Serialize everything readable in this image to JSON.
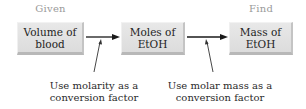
{
  "headers": {
    "given": "Given",
    "find": "Find"
  },
  "boxes": [
    {
      "line1": "Volume of",
      "line2": "blood"
    },
    {
      "line1": "Moles of",
      "line2": "EtOH"
    },
    {
      "line1": "Mass of",
      "line2": "EtOH"
    }
  ],
  "notes": [
    {
      "line1": "Use molarity as a",
      "line2": "conversion factor"
    },
    {
      "line1": "Use molar mass as a",
      "line2": "conversion factor"
    }
  ],
  "colors": {
    "box_fill": "#e0e0e0",
    "header_text": "#9a9a9a",
    "arrow": "#1a1a1a"
  }
}
